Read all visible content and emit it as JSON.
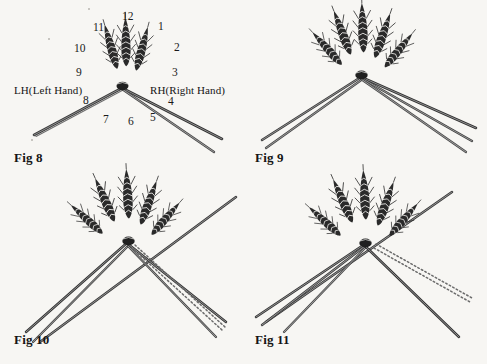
{
  "page": {
    "background_color": "#f7f6f3",
    "ink_color": "#1a1a1a",
    "width": 487,
    "height": 364
  },
  "figures": [
    {
      "id": "fig8",
      "caption": "Fig 8",
      "ear_count": 3,
      "straw_groups": [
        {
          "side": "left",
          "count": 1
        },
        {
          "side": "right",
          "count": 2
        }
      ],
      "dotted_straw": false,
      "clock_numbers": [
        "1",
        "2",
        "3",
        "4",
        "5",
        "6",
        "7",
        "8",
        "9",
        "10",
        "11",
        "12"
      ],
      "hand_labels": {
        "left": "LH(Left Hand)",
        "right": "RH(Right Hand)"
      }
    },
    {
      "id": "fig9",
      "caption": "Fig 9",
      "ear_count": 5,
      "straw_groups": [
        {
          "side": "left",
          "count": 2
        },
        {
          "side": "right",
          "count": 3
        }
      ],
      "dotted_straw": false
    },
    {
      "id": "fig10",
      "caption": "Fig 10",
      "ear_count": 5,
      "straw_groups": [
        {
          "side": "left",
          "count": 2
        },
        {
          "side": "right",
          "count": 2
        },
        {
          "side": "upper-right",
          "count": 1
        }
      ],
      "dotted_straw": true
    },
    {
      "id": "fig11",
      "caption": "Fig 11",
      "ear_count": 5,
      "straw_groups": [
        {
          "side": "left",
          "count": 3
        },
        {
          "side": "right",
          "count": 1
        },
        {
          "side": "upper-right",
          "count": 1
        }
      ],
      "dotted_straw": true
    }
  ]
}
